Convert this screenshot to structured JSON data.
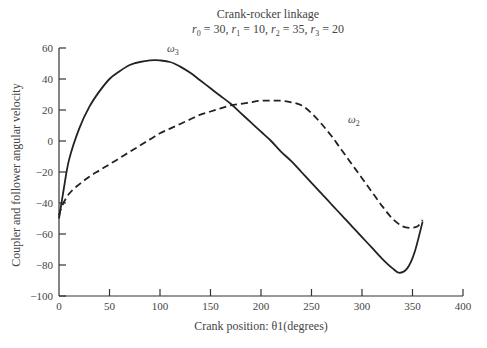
{
  "chart_data": {
    "type": "line",
    "title": "Crank-rocker linkage",
    "subtitle": "r0 = 30, r1 = 10, r2 = 35, r3 = 20",
    "xlabel": "Crank position: θ1(degrees)",
    "ylabel": "Coupler and follower angular velocity",
    "xlim": [
      0,
      400
    ],
    "ylim": [
      -100,
      60
    ],
    "xticks": [
      0,
      50,
      100,
      150,
      200,
      250,
      300,
      350,
      400
    ],
    "yticks": [
      60,
      40,
      20,
      0,
      -20,
      -40,
      -60,
      -80,
      -100
    ],
    "grid": false,
    "legend": "inline labels",
    "series": [
      {
        "name": "ω3",
        "style": "solid",
        "x": [
          0,
          5,
          10,
          20,
          30,
          40,
          50,
          60,
          70,
          80,
          90,
          100,
          110,
          120,
          130,
          140,
          150,
          160,
          170,
          180,
          190,
          200,
          210,
          220,
          230,
          240,
          250,
          260,
          270,
          280,
          290,
          300,
          310,
          320,
          330,
          337,
          345,
          352,
          360
        ],
        "values": [
          -50,
          -30,
          -12,
          8,
          22,
          32,
          40,
          45,
          49,
          51,
          52,
          52,
          51,
          48,
          44,
          39,
          34,
          29,
          24,
          18,
          12,
          6,
          0,
          -7,
          -13,
          -20,
          -27,
          -34,
          -41,
          -48,
          -55,
          -62,
          -69,
          -76,
          -82,
          -85,
          -82,
          -72,
          -52
        ]
      },
      {
        "name": "ω2",
        "style": "dashed",
        "x": [
          0,
          3,
          10,
          20,
          30,
          40,
          50,
          60,
          70,
          80,
          90,
          100,
          110,
          120,
          130,
          140,
          150,
          160,
          170,
          180,
          190,
          200,
          210,
          220,
          230,
          240,
          250,
          260,
          270,
          280,
          290,
          300,
          310,
          320,
          330,
          340,
          348,
          355,
          360
        ],
        "values": [
          -48,
          -42,
          -34,
          -28,
          -23,
          -19,
          -15,
          -11,
          -7,
          -3,
          1,
          5,
          8,
          11,
          14,
          17,
          19,
          21,
          23,
          24,
          25,
          26,
          26,
          26,
          25,
          23,
          18,
          11,
          3,
          -6,
          -15,
          -24,
          -33,
          -42,
          -50,
          -55,
          -56,
          -55,
          -51
        ]
      }
    ],
    "labels": {
      "omega3": {
        "base": "ω",
        "sub": "3"
      },
      "omega2": {
        "base": "ω",
        "sub": "2"
      },
      "title_sub": {
        "r0": "30",
        "r1": "10",
        "r2": "35",
        "r3": "20"
      }
    }
  }
}
